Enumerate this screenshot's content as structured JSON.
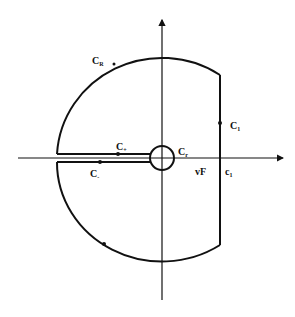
{
  "diagram": {
    "type": "contour-integration",
    "labels": {
      "big_arc": {
        "main": "C",
        "sub": "R"
      },
      "vertical_line": {
        "main": "C",
        "sub": "1"
      },
      "upper_cut": {
        "main": "C",
        "sub": "+"
      },
      "lower_cut": {
        "main": "C",
        "sub": "-"
      },
      "small_circle": {
        "main": "C",
        "sub": "r"
      },
      "axis_point": "vF",
      "intercept": {
        "main": "c",
        "sub": "1"
      }
    },
    "colors": {
      "stroke": "#111111",
      "background": "#ffffff"
    }
  }
}
